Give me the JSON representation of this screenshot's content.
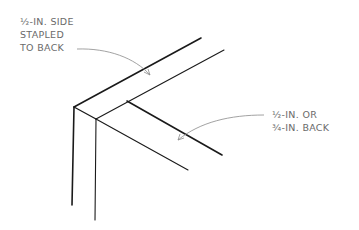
{
  "diagram": {
    "type": "technical-illustration",
    "annotations": [
      {
        "id": "side",
        "lines": [
          "½-IN. SIDE",
          "STAPLED",
          "TO BACK"
        ]
      },
      {
        "id": "back",
        "lines": [
          "½-IN. OR",
          "¾-IN. BACK"
        ]
      }
    ],
    "colors": {
      "stroke": "#1a1a1a",
      "leader": "#8a8a8a",
      "text": "#6a6a6a",
      "background": "#ffffff"
    }
  }
}
